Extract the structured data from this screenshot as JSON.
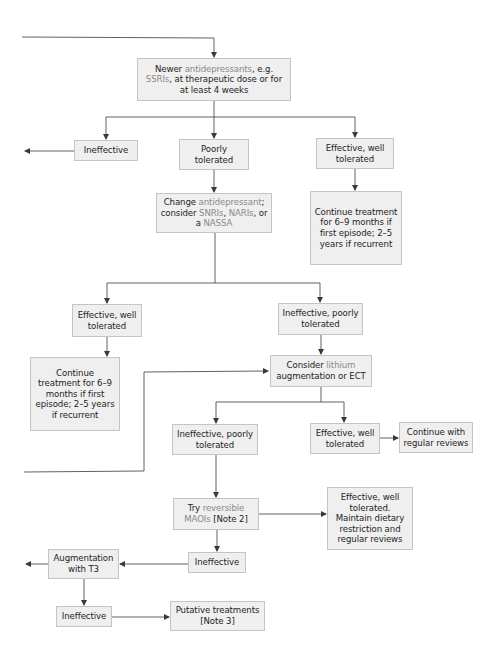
{
  "diagram": {
    "type": "flowchart",
    "colors": {
      "box_fill": "#efefef",
      "box_border": "#c4c4c4",
      "line": "#3a3a3a",
      "highlight_text": "#8a8a8a",
      "text": "#1e1e1e"
    },
    "nodes": {
      "start": {
        "pre": "Newer ",
        "hl1": "antidepressants",
        "mid": ", e.g. ",
        "hl2": "SSRIs",
        "post": ", at therapeutic dose or for at least 4 weeks"
      },
      "ineffective1": {
        "label": "Ineffective"
      },
      "poorly_tolerated": {
        "label": "Poorly tolerated"
      },
      "effective1": {
        "label": "Effective, well tolerated"
      },
      "continue1": {
        "label": "Continue treatment for 6–9 months if first episode; 2–5 years if recurrent"
      },
      "change": {
        "pre": "Change ",
        "hl1": "antidepressant",
        "mid1": "; consider ",
        "hl2": "SNRIs",
        "mid2": ", ",
        "hl3": "NARIs",
        "mid3": ", or a ",
        "hl4": "NASSA"
      },
      "effective2": {
        "label": "Effective, well tolerated"
      },
      "ineffective_poor1": {
        "label": "Ineffective, poorly tolerated"
      },
      "continue2": {
        "label": "Continue treatment for 6–9 months if first episode; 2–5 years if recurrent"
      },
      "lithium": {
        "pre": "Consider ",
        "hl1": "lithium",
        "post": " augmentation or ECT"
      },
      "ineffective_poor2": {
        "label": "Ineffective, poorly tolerated"
      },
      "effective3": {
        "label": "Effective, well tolerated"
      },
      "continue_reviews": {
        "label": "Continue with regular reviews"
      },
      "maoi": {
        "pre": "Try ",
        "hl1": "reversible MAOIs",
        "post": " [Note 2]"
      },
      "effective_maoi": {
        "label": "Effective, well tolerated. Maintain dietary restriction and regular reviews"
      },
      "ineffective3": {
        "label": "Ineffective"
      },
      "t3": {
        "label": "Augmentation with T3"
      },
      "ineffective4": {
        "label": "Ineffective"
      },
      "putative": {
        "label": "Putative treatments [Note 3]"
      }
    }
  }
}
